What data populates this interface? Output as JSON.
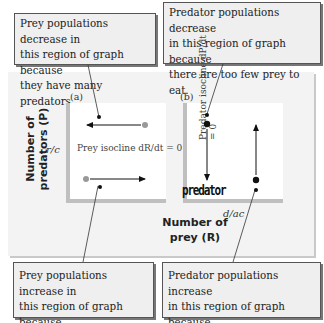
{
  "callouts": {
    "top_left": "Prey populations decrease in\nthis region of graph because\nthey have many predators.",
    "top_right": "Predator populations decrease\nin this region of graph because\nthere are too few prey to eat.",
    "bottom_left": "Prey populations increase in\nthis region of graph because\nthey have few predators.",
    "bottom_right": "Predator populations increase\nin this region of graph because\nthey have many prey to eat."
  },
  "panels": {
    "a": {
      "label": "(a)",
      "y_tick": "r/c",
      "isocline_label": "Prey isocline dR/dt = 0"
    },
    "b": {
      "label": "(b)",
      "x_tick": "d/ac",
      "isocline_label": "Predator isocline dP/dt = 0",
      "handwritten_annotation": "predator"
    }
  },
  "axes": {
    "y_label_line1": "Number of",
    "y_label_line2": "predators (P)",
    "x_label_line1": "Number of",
    "x_label_line2": "prey (R)"
  },
  "colors": {
    "callout_bg": "#efefef",
    "panel_bg": "#f3f3f3",
    "axis_gray": "#bfbfbf",
    "dot_gray": "#999999",
    "dot_black": "#111111"
  }
}
